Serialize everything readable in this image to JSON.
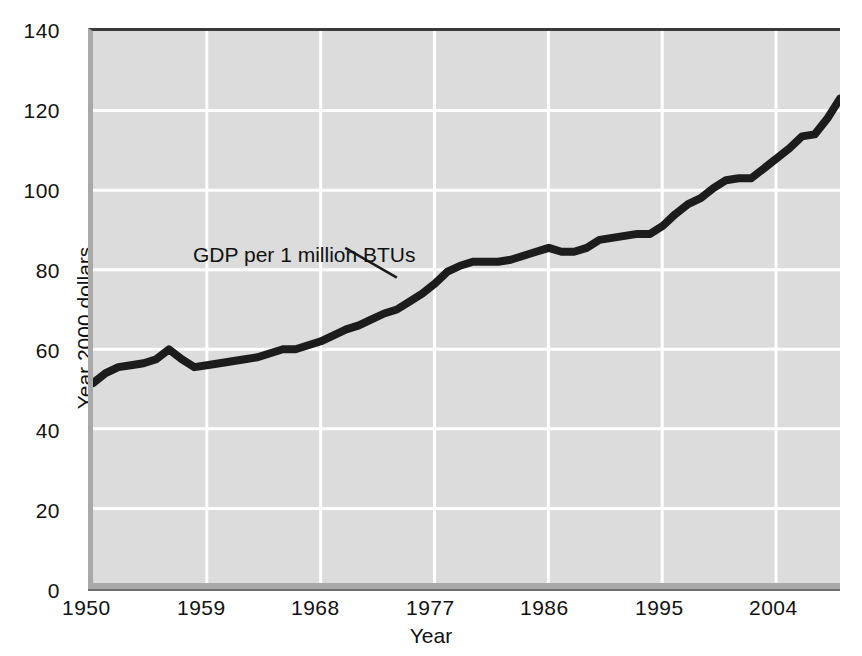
{
  "chart_data": {
    "type": "line",
    "title": "",
    "xlabel": "Year",
    "ylabel": "Year 2000 dollars",
    "xlim": [
      1950,
      2009
    ],
    "ylim": [
      0,
      140
    ],
    "grid": true,
    "legend_position": "none",
    "y_ticks": [
      0,
      20,
      40,
      60,
      80,
      100,
      120,
      140
    ],
    "x_ticks": [
      1950,
      1959,
      1968,
      1977,
      1986,
      1995,
      2004
    ],
    "annotations": [
      {
        "text": "GDP per 1 million BTUs",
        "x": 1957,
        "y": 85,
        "leader_to_x": 1974,
        "leader_to_y": 78
      }
    ],
    "series": [
      {
        "name": "GDP per 1 million BTUs",
        "color": "#1c1c1c",
        "x": [
          1950,
          1951,
          1952,
          1953,
          1954,
          1955,
          1956,
          1957,
          1958,
          1959,
          1960,
          1961,
          1962,
          1963,
          1964,
          1965,
          1966,
          1967,
          1968,
          1969,
          1970,
          1971,
          1972,
          1973,
          1974,
          1975,
          1976,
          1977,
          1978,
          1979,
          1980,
          1981,
          1982,
          1983,
          1984,
          1985,
          1986,
          1987,
          1988,
          1989,
          1990,
          1991,
          1992,
          1993,
          1994,
          1995,
          1996,
          1997,
          1998,
          1999,
          2000,
          2001,
          2002,
          2003,
          2004,
          2005,
          2006,
          2007,
          2008,
          2009
        ],
        "values": [
          51.5,
          54.0,
          55.5,
          56.0,
          56.5,
          57.5,
          60.0,
          57.5,
          55.5,
          56.0,
          56.5,
          57.0,
          57.5,
          58.0,
          59.0,
          60.0,
          60.0,
          61.0,
          62.0,
          63.5,
          65.0,
          66.0,
          67.5,
          69.0,
          70.0,
          72.0,
          74.0,
          76.5,
          79.5,
          81.0,
          82.0,
          82.0,
          82.0,
          82.5,
          83.5,
          84.5,
          85.5,
          84.5,
          84.5,
          85.5,
          87.5,
          88.0,
          88.5,
          89.0,
          89.0,
          91.0,
          94.0,
          96.5,
          98.0,
          100.5,
          102.5,
          103.0,
          103.0,
          105.5,
          108.0,
          110.5,
          113.5,
          114.0,
          118.0,
          123.0
        ]
      }
    ]
  },
  "y_tick_labels": [
    "140",
    "120",
    "100",
    "80",
    "60",
    "40",
    "20",
    "0"
  ],
  "x_tick_labels": [
    "1950",
    "1959",
    "1968",
    "1977",
    "1986",
    "1995",
    "2004"
  ],
  "axis_titles": {
    "x": "Year",
    "y": "Year 2000 dollars"
  },
  "annotation_label": "GDP per 1 million BTUs",
  "colors": {
    "plot_background": "#dcdcdc",
    "gridline": "#ffffff",
    "series_line": "#1c1c1c",
    "frame_top": "#3a3a3a",
    "frame_left": "#a9a9a9",
    "text": "#111111"
  }
}
